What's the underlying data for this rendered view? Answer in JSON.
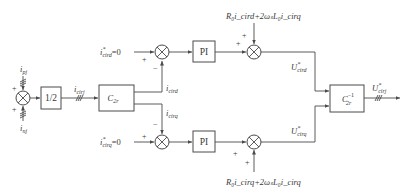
{
  "diagram": {
    "type": "control-block-diagram",
    "inputs": {
      "ipj": {
        "base": "i",
        "sub": "pj"
      },
      "inj": {
        "base": "i",
        "sub": "nj"
      }
    },
    "blocks": {
      "half": "1/2",
      "c2r": {
        "base": "C",
        "sub": "2r"
      },
      "pi_d": "PI",
      "pi_q": "PI",
      "c2r_inv": {
        "base": "C",
        "sub": "2r",
        "sup": "−1"
      }
    },
    "signals": {
      "icirj": {
        "base": "i",
        "sub": "cirj"
      },
      "icird": {
        "base": "i",
        "sub": "cird"
      },
      "icirq": {
        "base": "i",
        "sub": "cirq"
      },
      "icird_ref": {
        "base": "i",
        "sup": "*",
        "sub": "cird",
        "suffix": "=0"
      },
      "icirq_ref": {
        "base": "i",
        "sup": "*",
        "sub": "cirq",
        "suffix": "=0"
      },
      "ucird_ref": {
        "base": "U",
        "sup": "*",
        "sub": "cird"
      },
      "ucirq_ref": {
        "base": "U",
        "sup": "*",
        "sub": "cirq"
      },
      "ucirj_ref": {
        "base": "U",
        "sup": "*",
        "sub": "cirj"
      },
      "ff_d": "R₀i_cird+2ωₛL₀i_cirq",
      "ff_q": "R₀i_cirq+2ωₛL₀i_cirq"
    },
    "signs": {
      "plus": "+",
      "minus": "−"
    }
  }
}
